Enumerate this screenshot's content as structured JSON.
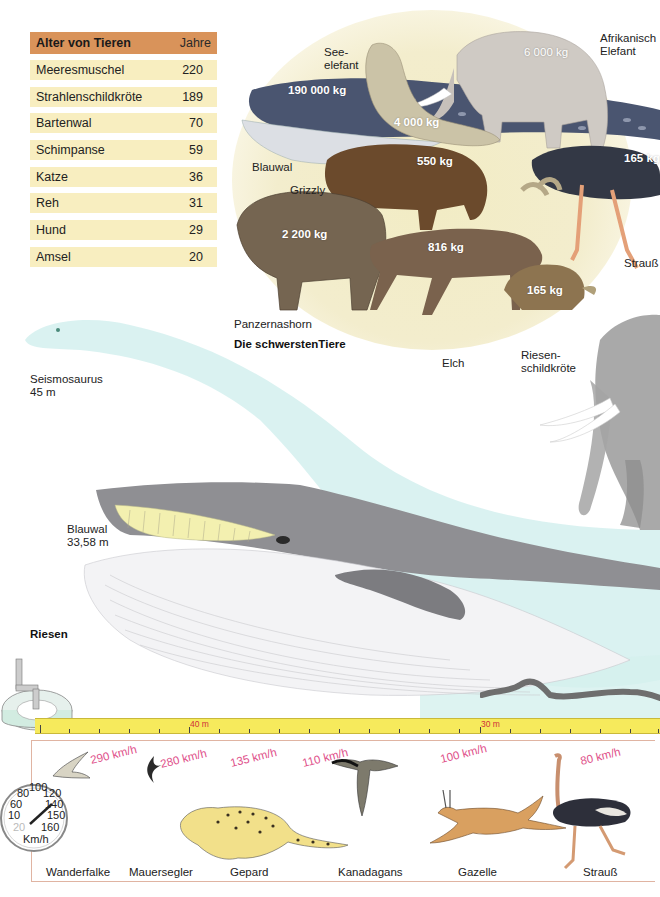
{
  "age_table": {
    "title": "Alter von Tieren",
    "unit": "Jahre",
    "rows": [
      {
        "name": "Meeresmuschel",
        "years": "220"
      },
      {
        "name": "Strahlenschildkröte",
        "years": "189"
      },
      {
        "name": "Bartenwal",
        "years": "70"
      },
      {
        "name": "Schimpanse",
        "years": "59"
      },
      {
        "name": "Katze",
        "years": "36"
      },
      {
        "name": "Reh",
        "years": "31"
      },
      {
        "name": "Hund",
        "years": "29"
      },
      {
        "name": "Amsel",
        "years": "20"
      }
    ]
  },
  "heaviest": {
    "title": "Die schwerstenTiere",
    "animals": [
      {
        "name": "Blauwal",
        "weight": "190 000 kg"
      },
      {
        "name": "See-\nelefant",
        "weight": "4 000 kg"
      },
      {
        "name": "Afrikanisch\nElefant",
        "weight": "6 000 kg"
      },
      {
        "name": "Grizzly",
        "weight": "550 kg"
      },
      {
        "name": "Strauß",
        "weight": "165 kg"
      },
      {
        "name": "Panzernashorn",
        "weight": "2 200 kg"
      },
      {
        "name": "Elch",
        "weight": "816 kg"
      },
      {
        "name": "Riesen-\nschildkröte",
        "weight": "165 kg"
      }
    ]
  },
  "giants": {
    "title": "Riesen",
    "animals": [
      {
        "name": "Seismosaurus",
        "length": "45 m"
      },
      {
        "name": "Blauwal",
        "length": "33,58 m"
      }
    ],
    "ruler_marks": [
      "40 m",
      "30 m"
    ]
  },
  "speeds": {
    "gauge_labels": [
      "80",
      "100",
      "120",
      "60",
      "140",
      "10",
      "150",
      "20",
      "160",
      "Km/h"
    ],
    "animals": [
      {
        "name": "Wanderfalke",
        "speed": "290 km/h"
      },
      {
        "name": "Mauersegler",
        "speed": "280 km/h"
      },
      {
        "name": "Gepard",
        "speed": "135 km/h"
      },
      {
        "name": "Kanadagans",
        "speed": "110 km/h"
      },
      {
        "name": "Gazelle",
        "speed": "100 km/h"
      },
      {
        "name": "Strauß",
        "speed": "80 km/h"
      }
    ]
  },
  "colors": {
    "table_header": "#d9935a",
    "table_row": "#f8eec0",
    "speed_text": "#e0508a",
    "ruler": "#f6ea5c",
    "ruler_marks": "#d0303a",
    "ghost_seismosaurus": "#cdeeed"
  }
}
